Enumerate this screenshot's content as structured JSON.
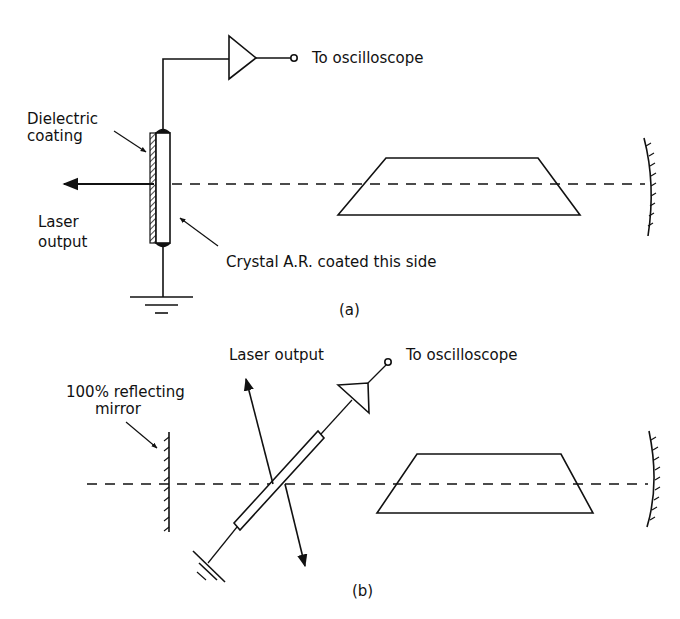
{
  "diagram": {
    "type": "optical-setup",
    "colors": {
      "line": "#111111",
      "background": "#ffffff"
    },
    "panel_a": {
      "caption": "(a)",
      "labels": {
        "to_oscilloscope": "To oscilloscope",
        "dielectric_coating_1": "Dielectric",
        "dielectric_coating_2": "coating",
        "laser_output_1": "Laser",
        "laser_output_2": "output",
        "crystal": "Crystal A.R. coated this side"
      }
    },
    "panel_b": {
      "caption": "(b)",
      "labels": {
        "laser_output": "Laser output",
        "to_oscilloscope": "To oscilloscope",
        "mirror_1": "100% reflecting",
        "mirror_2": "mirror"
      }
    }
  }
}
